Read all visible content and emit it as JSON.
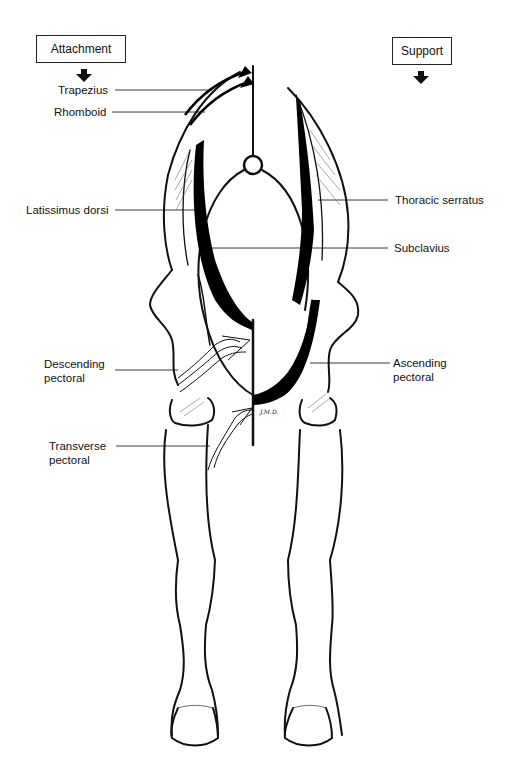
{
  "headers": {
    "attachment": "Attachment",
    "support": "Support"
  },
  "labels": {
    "trapezius": "Trapezius",
    "rhomboid": "Rhomboid",
    "latissimus_dorsi": "Latissimus dorsi",
    "descending_pectoral_1": "Descending",
    "descending_pectoral_2": "pectoral",
    "transverse_pectoral_1": "Transverse",
    "transverse_pectoral_2": "pectoral",
    "thoracic_serratus": "Thoracic serratus",
    "subclavius": "Subclavius",
    "ascending_pectoral_1": "Ascending",
    "ascending_pectoral_2": "pectoral"
  },
  "signature": "J.M.D.",
  "colors": {
    "ink": "#111111",
    "background": "#ffffff",
    "muscle_fill": "#000000"
  }
}
